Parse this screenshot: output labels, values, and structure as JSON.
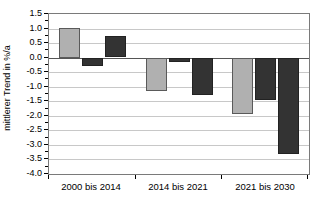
{
  "chart_data": {
    "type": "bar",
    "title": "",
    "xlabel": "",
    "ylabel": "mittlerer Trend in %/a",
    "categories": [
      "2000 bis 2014",
      "2014 bis 2021",
      "2021 bis 2030"
    ],
    "series": [
      {
        "name": "series-1",
        "color": "#b0b0b0",
        "values": [
          1.02,
          -1.12,
          -1.93
        ]
      },
      {
        "name": "series-2",
        "color": "#333333",
        "values": [
          -0.28,
          -0.15,
          -1.45
        ]
      },
      {
        "name": "series-3",
        "color": "#333333",
        "values": [
          0.73,
          -1.28,
          -3.3
        ]
      }
    ],
    "ylim": [
      -4.0,
      1.5
    ],
    "ytick_values": [
      1.5,
      1.0,
      0.5,
      0.0,
      -0.5,
      -1.0,
      -1.5,
      -2.0,
      -2.5,
      -3.0,
      -3.5,
      -4.0
    ],
    "ytick_labels": [
      "1.5",
      "1.0",
      "0.5",
      "0.0",
      "-0.5",
      "-1.0",
      "-1.5",
      "-2.0",
      "-2.5",
      "-3.0",
      "-3.5",
      "-4.0"
    ],
    "grid": true,
    "legend": "none",
    "zero_line": 0.0,
    "colors": {
      "light_bar": "#b0b0b0",
      "dark_bar": "#333333",
      "gridline": "#c8c8c8",
      "axis": "#7a7a7a",
      "text": "#000000",
      "background": "#ffffff"
    }
  }
}
